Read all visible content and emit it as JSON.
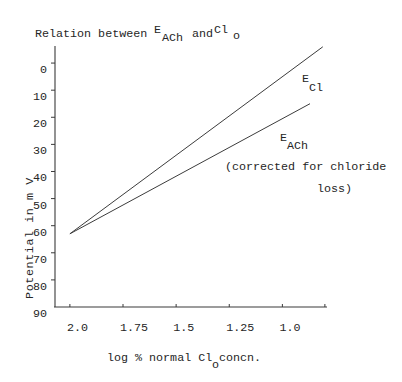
{
  "title": {
    "text_a": "Relation between ",
    "e": "E",
    "sub_a": "ACh",
    "text_b": "and ",
    "cl": "Cl",
    "sub_b": "o"
  },
  "axes": {
    "ylabel": "Potential in m V",
    "xlabel_a": "log % normal Cl",
    "xlabel_sub": "o",
    "xlabel_b": " concn."
  },
  "labels": {
    "ecl_main": "E",
    "ecl_sub": "Cl",
    "each_main": "E",
    "each_sub": "ACh",
    "each_note_1": "(corrected for chloride",
    "each_note_2": "loss)"
  },
  "chart_data": {
    "type": "line",
    "xlabel": "log % normal Cl_o concn.",
    "ylabel": "Potential in m V",
    "x_ticks": [
      2.0,
      1.75,
      1.5,
      1.25,
      1.0,
      0.8
    ],
    "x_tick_labels": [
      "2.0",
      "1.75",
      "1.5",
      "1.25",
      "1.0",
      ""
    ],
    "y_ticks": [
      0,
      10,
      20,
      30,
      40,
      50,
      60,
      70,
      80,
      90
    ],
    "y_tick_labels": [
      "0",
      "10",
      "20",
      "30",
      "40",
      "50",
      "60",
      "70",
      "80",
      "90"
    ],
    "xlim": [
      2.07,
      0.79
    ],
    "ylim": [
      -6.3,
      90
    ],
    "x_inverted": true,
    "y_inverted": true,
    "grid": false,
    "legend": "none (series labeled directly on plot)",
    "series": [
      {
        "name": "E_Cl",
        "x": [
          2.0,
          0.81
        ],
        "y": [
          63,
          -6
        ]
      },
      {
        "name": "E_ACh (corrected for chloride loss)",
        "x": [
          2.0,
          0.87
        ],
        "y": [
          63,
          15
        ]
      }
    ],
    "annotations": [
      "E_Cl",
      "E_ACh",
      "(corrected for chloride loss)"
    ]
  }
}
